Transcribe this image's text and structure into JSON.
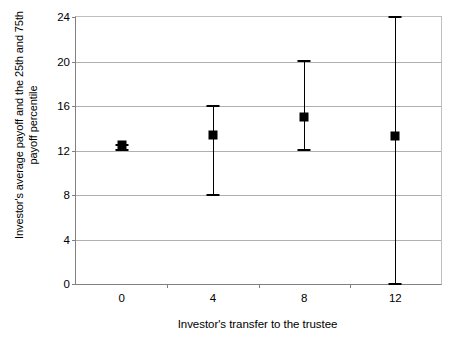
{
  "chart_data": {
    "type": "scatter",
    "title": "",
    "xlabel": "Investor's transfer to the trustee",
    "ylabel_line1": "Investor's average payoff and the 25th and 75th",
    "ylabel_line2": "payoff percentile",
    "categories": [
      "0",
      "4",
      "8",
      "12"
    ],
    "x": [
      0,
      4,
      8,
      12
    ],
    "values": [
      12.5,
      13.4,
      15.0,
      13.3
    ],
    "lower": [
      12.1,
      8.1,
      12.1,
      0.1
    ],
    "upper": [
      12.6,
      16.1,
      20.1,
      24.1
    ],
    "series": [
      {
        "name": "Investor's average payoff",
        "values": [
          12.5,
          13.4,
          15.0,
          13.3
        ]
      },
      {
        "name": "25th payoff percentile",
        "values": [
          12.1,
          8.1,
          12.1,
          0.1
        ]
      },
      {
        "name": "75th payoff percentile",
        "values": [
          12.6,
          16.1,
          20.1,
          24.1
        ]
      }
    ],
    "ylim": [
      0,
      24
    ],
    "yticks": [
      0,
      4,
      8,
      12,
      16,
      20,
      24
    ],
    "ytick_labels": [
      "0",
      "4",
      "8",
      "12",
      "16",
      "20",
      "24"
    ],
    "grid": "horizontal",
    "legend": "none",
    "marker_color": "#000000",
    "gridline_color": "#b0b0b0",
    "axis_color": "#808080",
    "background": "#ffffff"
  }
}
